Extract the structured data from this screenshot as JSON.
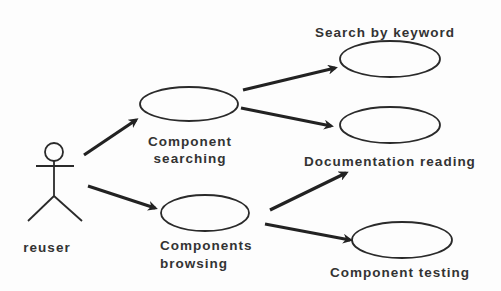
{
  "diagram": {
    "type": "uml-use-case",
    "actor": {
      "label": "reuser"
    },
    "use_cases": [
      {
        "id": "component-searching",
        "label_line1": "Component",
        "label_line2": "searching"
      },
      {
        "id": "search-by-keyword",
        "label_line1": "Search by keyword"
      },
      {
        "id": "documentation-reading",
        "label_line1": "Documentation reading"
      },
      {
        "id": "components-browsing",
        "label_line1": "Components",
        "label_line2": "browsing"
      },
      {
        "id": "component-testing",
        "label_line1": "Component testing"
      }
    ],
    "edges": [
      {
        "from": "reuser",
        "to": "component-searching"
      },
      {
        "from": "reuser",
        "to": "components-browsing"
      },
      {
        "from": "component-searching",
        "to": "search-by-keyword"
      },
      {
        "from": "component-searching",
        "to": "documentation-reading"
      },
      {
        "from": "components-browsing",
        "to": "documentation-reading"
      },
      {
        "from": "components-browsing",
        "to": "component-testing"
      }
    ],
    "colors": {
      "stroke": "#2a2a2a",
      "text": "#333333",
      "background": "#fdfdfd"
    }
  }
}
